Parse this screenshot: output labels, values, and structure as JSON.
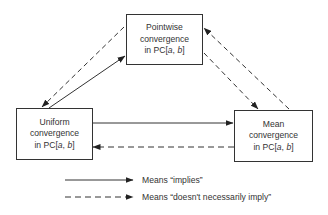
{
  "nodes": {
    "pointwise": {
      "line1": "Pointwise",
      "line2": "convergence",
      "line3_prefix": "in PC[",
      "line3_a": "a",
      "line3_sep": ", ",
      "line3_b": "b",
      "line3_suffix": "]"
    },
    "uniform": {
      "line1": "Uniform",
      "line2": "convergence",
      "line3_prefix": "in PC[",
      "line3_a": "a",
      "line3_sep": ", ",
      "line3_b": "b",
      "line3_suffix": "]"
    },
    "mean": {
      "line1": "Mean",
      "line2": "convergence",
      "line3_prefix": "in PC[",
      "line3_a": "a",
      "line3_sep": ", ",
      "line3_b": "b",
      "line3_suffix": "]"
    }
  },
  "edges": [
    {
      "from": "Uniform",
      "to": "Pointwise",
      "style": "solid",
      "meaning": "implies"
    },
    {
      "from": "Pointwise",
      "to": "Uniform",
      "style": "dashed",
      "meaning": "doesn't necessarily imply"
    },
    {
      "from": "Uniform",
      "to": "Mean",
      "style": "solid",
      "meaning": "implies"
    },
    {
      "from": "Mean",
      "to": "Uniform",
      "style": "dashed",
      "meaning": "doesn't necessarily imply"
    },
    {
      "from": "Pointwise",
      "to": "Mean",
      "style": "dashed",
      "meaning": "doesn't necessarily imply"
    },
    {
      "from": "Mean",
      "to": "Pointwise",
      "style": "dashed",
      "meaning": "doesn't necessarily imply"
    }
  ],
  "legend": {
    "solid_label": "Means “implies”",
    "dashed_label": "Means “doesn't necessarily imply”"
  }
}
